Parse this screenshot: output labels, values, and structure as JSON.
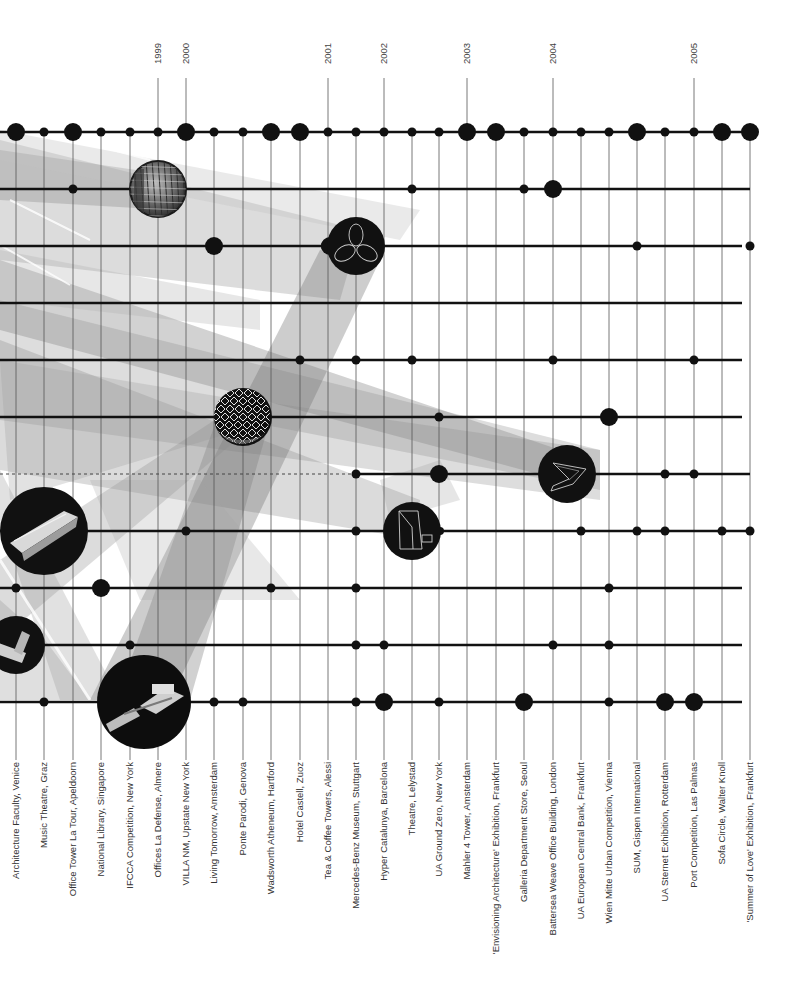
{
  "chart_data": {
    "type": "timeline-matrix",
    "title": "",
    "x_axis": "projects (chronological)",
    "years": [
      {
        "label": "1999",
        "column": 5
      },
      {
        "label": "2000",
        "column": 6
      },
      {
        "label": "2001",
        "column": 11
      },
      {
        "label": "2002",
        "column": 13
      },
      {
        "label": "2003",
        "column": 16
      },
      {
        "label": "2004",
        "column": 19
      },
      {
        "label": "2005",
        "column": 24
      }
    ],
    "projects": [
      "Architecture Faculty, Venice",
      "Music Theatre, Graz",
      "Office Tower La Tour, Apeldoorn",
      "National Library, Singapore",
      "IFCCA Competition, New York",
      "Offices La Defense, Almere",
      "VILLA NM, Upstate New York",
      "Living Tomorrow, Amsterdam",
      "Ponte Parodi, Genova",
      "Wadsworth Atheneum, Hartford",
      "Hotel Castell, Zuoz",
      "Tea & Coffee Towers, Alessi",
      "Mercedes-Benz Museum, Stuttgart",
      "Hyper Catalunya, Barcelona",
      "Theatre, Lelystad",
      "UA Ground Zero, New York",
      "Mahler 4 Tower, Amsterdam",
      "'Envisioning Architecture' Exhibition, Frankfurt",
      "Galleria Department Store, Seoul",
      "Battersea Weave Office Building, London",
      "UA European Central Bank, Frankfurt",
      "Wien Mitte Urban Competition, Vienna",
      "SUM, Gispen International",
      "UA Sternet Exhibition, Rotterdam",
      "Port Competition, Las Palmas",
      "Sofa Circle, Walter Knoll",
      "'Summer of Love' Exhibition, Frankfurt"
    ],
    "rows": [
      {
        "index": 0,
        "nodes": [
          [
            0,
            "L"
          ],
          [
            1,
            "S"
          ],
          [
            2,
            "L"
          ],
          [
            3,
            "S"
          ],
          [
            4,
            "S"
          ],
          [
            5,
            "S"
          ],
          [
            6,
            "L"
          ],
          [
            7,
            "S"
          ],
          [
            8,
            "S"
          ],
          [
            9,
            "L"
          ],
          [
            10,
            "L"
          ],
          [
            11,
            "S"
          ],
          [
            12,
            "S"
          ],
          [
            13,
            "S"
          ],
          [
            14,
            "S"
          ],
          [
            15,
            "S"
          ],
          [
            16,
            "L"
          ],
          [
            17,
            "L"
          ],
          [
            18,
            "S"
          ],
          [
            19,
            "S"
          ],
          [
            20,
            "S"
          ],
          [
            21,
            "S"
          ],
          [
            22,
            "L"
          ],
          [
            23,
            "S"
          ],
          [
            24,
            "S"
          ],
          [
            25,
            "L"
          ],
          [
            26,
            "L"
          ]
        ],
        "end": 750,
        "dashed_to": null
      },
      {
        "index": 1,
        "nodes": [
          [
            2,
            "S"
          ],
          [
            5,
            "IMG:facade"
          ],
          [
            14,
            "S"
          ],
          [
            18,
            "S"
          ],
          [
            19,
            "L"
          ]
        ],
        "end": 750,
        "dashed_to": null
      },
      {
        "index": 2,
        "nodes": [
          [
            7,
            "L"
          ],
          [
            11,
            "M"
          ],
          [
            12,
            "IMG:trefoil"
          ],
          [
            22,
            "S"
          ],
          [
            26,
            "S"
          ]
        ],
        "end": 742,
        "dashed_to": null
      },
      {
        "index": 3,
        "nodes": [],
        "end": 742,
        "dashed_to": null
      },
      {
        "index": 4,
        "nodes": [
          [
            10,
            "S"
          ],
          [
            12,
            "S"
          ],
          [
            14,
            "S"
          ],
          [
            19,
            "S"
          ],
          [
            24,
            "S"
          ]
        ],
        "end": 742,
        "dashed_to": null
      },
      {
        "index": 5,
        "nodes": [
          [
            8,
            "IMG:lattice"
          ],
          [
            15,
            "S"
          ],
          [
            21,
            "L"
          ]
        ],
        "end": 742,
        "dashed_to": null
      },
      {
        "index": 6,
        "nodes": [
          [
            12,
            "S"
          ],
          [
            15,
            "L"
          ],
          [
            19.5,
            "IMG:chevron"
          ],
          [
            23,
            "S"
          ],
          [
            24,
            "S"
          ]
        ],
        "end": 750,
        "dashed_to": 12
      },
      {
        "index": 7,
        "nodes": [
          [
            1,
            "IMG:bar-model"
          ],
          [
            6,
            "S"
          ],
          [
            12,
            "S"
          ],
          [
            14,
            "IMG:theatre"
          ],
          [
            20,
            "S"
          ],
          [
            22,
            "S"
          ],
          [
            23,
            "S"
          ],
          [
            25,
            "S"
          ],
          [
            26,
            "S"
          ]
        ],
        "end": 750,
        "dashed_to": null
      },
      {
        "index": 8,
        "nodes": [
          [
            0,
            "S"
          ],
          [
            3,
            "L"
          ],
          [
            9,
            "S"
          ],
          [
            12,
            "S"
          ],
          [
            21,
            "S"
          ]
        ],
        "end": 742,
        "dashed_to": null
      },
      {
        "index": 9,
        "nodes": [
          [
            0,
            "IMG:model-small"
          ],
          [
            4,
            "S"
          ],
          [
            12,
            "S"
          ],
          [
            13,
            "S"
          ],
          [
            19,
            "S"
          ],
          [
            21,
            "S"
          ]
        ],
        "end": 742,
        "dashed_to": null
      },
      {
        "index": 10,
        "nodes": [
          [
            1,
            "S"
          ],
          [
            4.5,
            "IMG:model-large"
          ],
          [
            7,
            "S"
          ],
          [
            8,
            "S"
          ],
          [
            12,
            "S"
          ],
          [
            13,
            "L"
          ],
          [
            15,
            "S"
          ],
          [
            18,
            "L"
          ],
          [
            21,
            "S"
          ],
          [
            23,
            "L"
          ],
          [
            24,
            "L"
          ]
        ],
        "end": 742,
        "dashed_to": null
      }
    ],
    "legend": [],
    "grid": true
  },
  "layout": {
    "column_x": [
      16,
      44,
      73,
      101,
      130,
      158,
      186,
      214,
      243,
      271,
      300,
      328,
      356,
      384,
      412,
      439,
      467,
      496,
      524,
      553,
      581,
      609,
      637,
      665,
      694,
      722,
      750
    ],
    "row_y": [
      132,
      189,
      246,
      303,
      360,
      417,
      474,
      531,
      588,
      645,
      702
    ],
    "colors": {
      "ink": "#111111",
      "grid": "#555555",
      "label": "#333333",
      "band": "#7a7a7a",
      "background": "#ffffff"
    }
  }
}
